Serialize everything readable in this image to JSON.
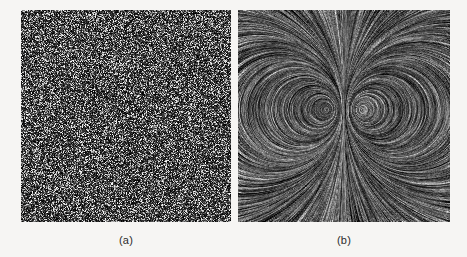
{
  "figure": {
    "background_color": "#f6f5f3",
    "panels": [
      {
        "id": "a",
        "caption": "(a)",
        "title": "white noise input texture",
        "type": "noise",
        "x": 21,
        "y": 10,
        "width": 210,
        "height": 212,
        "min_gray": 0,
        "max_gray": 255,
        "cell_size": 1
      },
      {
        "id": "b",
        "caption": "(b)",
        "title": "line integral convolution of noise with vector field",
        "type": "lic",
        "x": 238,
        "y": 10,
        "width": 212,
        "height": 212,
        "field": "counter-rotating dipole vortex pair",
        "vortex_centers": [
          {
            "x": 0.42,
            "y": 0.47,
            "strength": 1.0
          },
          {
            "x": 0.58,
            "y": 0.47,
            "strength": -1.0
          }
        ],
        "separatrix": "vertical center line",
        "streamline_length": 22,
        "min_gray": 0,
        "max_gray": 235
      }
    ]
  },
  "captions": {
    "a": "(a)",
    "b": "(b)"
  },
  "colors": {
    "page_background": "#f6f5f3",
    "image_dark": "#0d0d0d",
    "image_light": "#e8e8e8",
    "caption_text": "#2b2b2b"
  }
}
